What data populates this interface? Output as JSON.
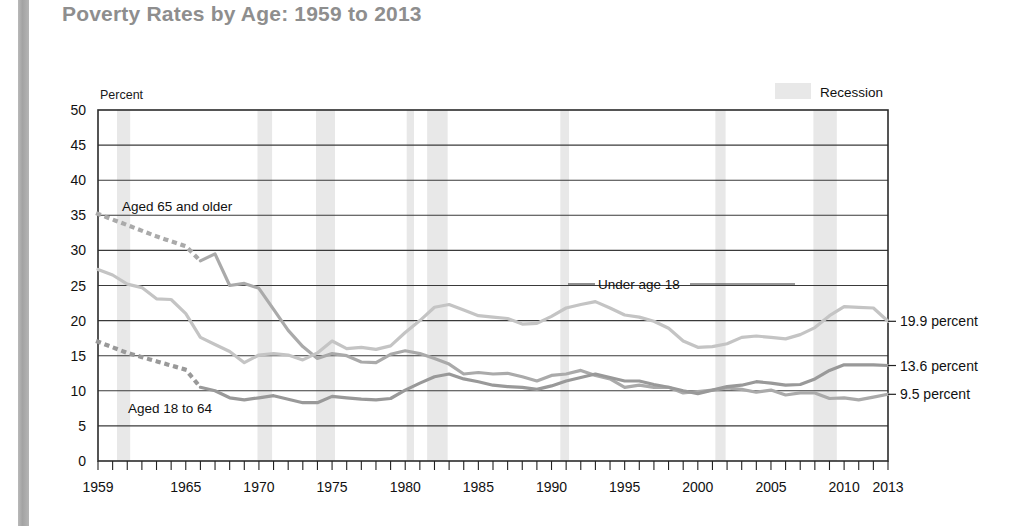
{
  "page": {
    "title": "Poverty Rates by Age: 1959 to 2013",
    "title_color": "#8e8e8e",
    "background": "#ffffff",
    "left_strip_color": "#a8a8a8"
  },
  "legend": {
    "recession_label": "Recession",
    "recession_swatch_color": "#e8e8e8",
    "position": "top-right"
  },
  "axis": {
    "y_axis_title": "Percent",
    "y_ticks": [
      "0",
      "5",
      "10",
      "15",
      "20",
      "25",
      "30",
      "35",
      "40",
      "45",
      "50"
    ],
    "x_ticks": [
      "1959",
      "1965",
      "1970",
      "1975",
      "1980",
      "1985",
      "1990",
      "1995",
      "2000",
      "2005",
      "2010",
      "2013"
    ]
  },
  "end_labels": [
    {
      "name": "under-18-end-label",
      "text": "19.9 percent",
      "value": 19.9
    },
    {
      "name": "aged-18-64-end-label",
      "text": "13.6 percent",
      "value": 13.6
    },
    {
      "name": "aged-65-plus-end-label",
      "text": "9.5 percent",
      "value": 9.5
    }
  ],
  "series_labels": [
    {
      "name": "aged-65-and-older-label",
      "text": "Aged 65 and older"
    },
    {
      "name": "under-age-18-label",
      "text": "Under age 18"
    },
    {
      "name": "aged-18-to-64-label",
      "text": "Aged 18 to 64"
    }
  ],
  "chart_data": {
    "type": "line",
    "title": "Poverty Rates by Age: 1959 to 2013",
    "xlabel": "",
    "ylabel": "Percent",
    "xlim": [
      1959,
      2013
    ],
    "ylim": [
      0,
      50
    ],
    "ytick_step": 5,
    "grid": "horizontal",
    "legend": "Recession",
    "x": [
      1959,
      1960,
      1961,
      1962,
      1963,
      1964,
      1965,
      1966,
      1967,
      1968,
      1969,
      1970,
      1971,
      1972,
      1973,
      1974,
      1975,
      1976,
      1977,
      1978,
      1979,
      1980,
      1981,
      1982,
      1983,
      1984,
      1985,
      1986,
      1987,
      1988,
      1989,
      1990,
      1991,
      1992,
      1993,
      1994,
      1995,
      1996,
      1997,
      1998,
      1999,
      2000,
      2001,
      2002,
      2003,
      2004,
      2005,
      2006,
      2007,
      2008,
      2009,
      2010,
      2011,
      2012,
      2013
    ],
    "series": [
      {
        "name": "Under age 18",
        "color": "#c4c4c4",
        "style": "solid",
        "values": [
          27.3,
          26.5,
          25.2,
          24.7,
          23.1,
          23.0,
          21.0,
          17.6,
          16.6,
          15.6,
          14.0,
          15.1,
          15.3,
          15.1,
          14.4,
          15.4,
          17.1,
          16.0,
          16.2,
          15.9,
          16.4,
          18.3,
          20.0,
          21.9,
          22.3,
          21.5,
          20.7,
          20.5,
          20.3,
          19.5,
          19.6,
          20.6,
          21.8,
          22.3,
          22.7,
          21.8,
          20.8,
          20.5,
          19.9,
          18.9,
          17.1,
          16.2,
          16.3,
          16.7,
          17.6,
          17.8,
          17.6,
          17.4,
          18.0,
          19.0,
          20.7,
          22.0,
          21.9,
          21.8,
          19.9
        ]
      },
      {
        "name": "Aged 18 to 64",
        "color": "#999999",
        "style": "dotted-then-solid",
        "dotted_through": 1966,
        "values": [
          17.0,
          16.2,
          15.4,
          14.8,
          14.2,
          13.6,
          13.0,
          10.5,
          10.0,
          9.0,
          8.7,
          9.0,
          9.3,
          8.8,
          8.3,
          8.3,
          9.2,
          9.0,
          8.8,
          8.7,
          8.9,
          10.1,
          11.1,
          12.0,
          12.4,
          11.7,
          11.3,
          10.8,
          10.6,
          10.5,
          10.2,
          10.7,
          11.4,
          11.9,
          12.4,
          11.9,
          11.4,
          11.4,
          10.9,
          10.5,
          10.0,
          9.6,
          10.1,
          10.6,
          10.8,
          11.3,
          11.1,
          10.8,
          10.9,
          11.7,
          12.9,
          13.7,
          13.7,
          13.7,
          13.6
        ]
      },
      {
        "name": "Aged 65 and older",
        "color": "#aaaaaa",
        "style": "dotted-then-solid",
        "dotted_through": 1966,
        "values": [
          35.2,
          34.4,
          33.6,
          32.8,
          32.0,
          31.3,
          30.6,
          28.5,
          29.5,
          25.0,
          25.3,
          24.6,
          21.6,
          18.6,
          16.3,
          14.6,
          15.3,
          15.0,
          14.1,
          14.0,
          15.2,
          15.7,
          15.3,
          14.6,
          13.8,
          12.4,
          12.6,
          12.4,
          12.5,
          12.0,
          11.4,
          12.2,
          12.4,
          12.9,
          12.2,
          11.7,
          10.5,
          10.8,
          10.5,
          10.5,
          9.7,
          9.9,
          10.1,
          10.4,
          10.2,
          9.8,
          10.1,
          9.4,
          9.7,
          9.7,
          8.9,
          9.0,
          8.7,
          9.1,
          9.5
        ]
      }
    ],
    "recessions": [
      {
        "start": 1960.3,
        "end": 1961.2
      },
      {
        "start": 1969.9,
        "end": 1970.9
      },
      {
        "start": 1973.9,
        "end": 1975.2
      },
      {
        "start": 1980.1,
        "end": 1980.6
      },
      {
        "start": 1981.5,
        "end": 1982.9
      },
      {
        "start": 1990.6,
        "end": 1991.2
      },
      {
        "start": 2001.2,
        "end": 2001.9
      },
      {
        "start": 2007.9,
        "end": 2009.5
      }
    ]
  }
}
